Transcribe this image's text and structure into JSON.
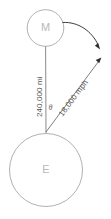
{
  "diagram": {
    "bodies": [
      {
        "id": "moon",
        "label": "M",
        "name": "moon-circle",
        "cx": 45.5,
        "cy": 28,
        "r": 18.5
      },
      {
        "id": "earth",
        "label": "E",
        "name": "earth-circle",
        "cx": 46,
        "cy": 170,
        "r": 37
      }
    ],
    "distance_label": "240,000 mi",
    "velocity_label": "18,000 mph",
    "angle_label": "θ",
    "colors": {
      "circle_stroke": "#a8a8a8",
      "body_letter": "#b9b9b9",
      "measure_line": "#7d7d7d",
      "vector_line": "#6f6f6f",
      "curve_arrow": "#3a3a3a",
      "label_text": "#555555",
      "background": "#ffffff"
    },
    "geometry": {
      "vertex_x": 46,
      "vertex_y": 132,
      "distance_line_from": [
        45.5,
        46.5
      ],
      "distance_line_to": [
        46,
        133
      ],
      "velocity_from": [
        46,
        132
      ],
      "velocity_to": [
        101,
        59
      ],
      "curve_from": [
        62,
        23
      ],
      "curve_to": [
        100,
        49
      ]
    }
  }
}
